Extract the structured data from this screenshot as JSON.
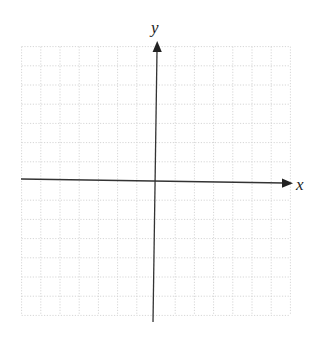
{
  "diagram": {
    "type": "cartesian-coordinate-grid",
    "x_axis_label": "x",
    "y_axis_label": "y",
    "grid": {
      "columns_left_of_origin": 7,
      "columns_right_of_origin": 7,
      "rows_above_origin": 7,
      "rows_below_origin": 7,
      "line_style": "dotted",
      "line_color": "#d6d6d6"
    },
    "axis_color": "#333333",
    "arrows": {
      "x_axis": "positive-direction-only",
      "y_axis": "positive-direction-only"
    }
  }
}
